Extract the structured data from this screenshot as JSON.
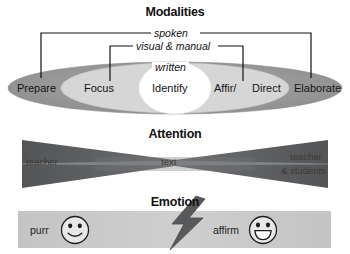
{
  "figure": {
    "background": "#ffffff"
  },
  "colors": {
    "outer_ellipse": "#9a9a9a",
    "middle_ellipse": "#d4d4d4",
    "inner_circle": "#ffffff",
    "attention_band_dark": "#58595b",
    "attention_band_light": "#7c7d7f",
    "emotion_band": "#c9c9c9",
    "bolt": "#58595b",
    "line": "#111111",
    "text": "#141414"
  },
  "modalities": {
    "title": "Modalities",
    "brackets": [
      {
        "label": "spoken",
        "span": "Prepare-to-Elaborate"
      },
      {
        "label": "visual & manual",
        "span": "Focus-to-Direct"
      },
      {
        "label": "written",
        "span": "Identify"
      }
    ],
    "nodes": [
      {
        "label": "Prepare",
        "ring": "outer"
      },
      {
        "label": "Focus",
        "ring": "middle"
      },
      {
        "label": "Identify",
        "ring": "inner"
      },
      {
        "label": "Affir/",
        "ring": "middle"
      },
      {
        "label": "Direct",
        "ring": "middle"
      },
      {
        "label": "Elaborate",
        "ring": "outer"
      }
    ]
  },
  "attention": {
    "title": "Attention",
    "left_label": "teacher",
    "center_label": "text",
    "right_label_line1": "teacher",
    "right_label_line2": "& students"
  },
  "emotion": {
    "title": "Emotion",
    "left_label": "purr",
    "right_label": "affirm",
    "left_face": "smiley-closed-smile-icon",
    "right_face": "smiley-open-grin-icon",
    "bolt": "lightning-bolt-icon"
  }
}
